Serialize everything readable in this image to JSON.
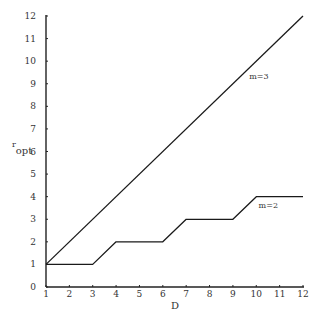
{
  "chart_data": {
    "type": "line",
    "title": "",
    "xlabel": "D",
    "ylabel": "r_opt",
    "ylabel_main": "r",
    "ylabel_sub": "opt",
    "xlim": [
      1,
      12
    ],
    "ylim": [
      0,
      12
    ],
    "x_ticks": [
      1,
      2,
      3,
      4,
      5,
      6,
      7,
      8,
      9,
      10,
      11,
      12
    ],
    "y_ticks": [
      0,
      1,
      2,
      3,
      4,
      5,
      6,
      7,
      8,
      9,
      10,
      11,
      12
    ],
    "grid": false,
    "legend": "none (inline series labels)",
    "series": [
      {
        "name": "m=3",
        "label": "m=3",
        "points": [
          [
            1,
            1
          ],
          [
            12,
            12
          ]
        ]
      },
      {
        "name": "m=2",
        "label": "m=2",
        "points": [
          [
            1,
            1
          ],
          [
            3,
            1
          ],
          [
            4,
            2
          ],
          [
            6,
            2
          ],
          [
            7,
            3
          ],
          [
            9,
            3
          ],
          [
            10,
            4
          ],
          [
            12,
            4
          ]
        ]
      }
    ],
    "annotations": [
      {
        "text": "m=3",
        "x": 9.7,
        "y": 9.2
      },
      {
        "text": "m=2",
        "x": 10.1,
        "y": 3.5
      }
    ]
  },
  "colors": {
    "axis": "#222222",
    "line": "#1a1a1a",
    "text": "#333333",
    "background": "#ffffff"
  }
}
